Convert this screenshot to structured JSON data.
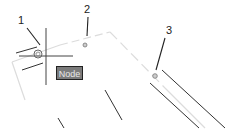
{
  "callouts": [
    {
      "label": "1"
    },
    {
      "label": "2"
    },
    {
      "label": "3"
    }
  ],
  "tooltip": {
    "text": "Node"
  },
  "colors": {
    "line": "#333333",
    "faint": "#d8d8d8",
    "tooltip_bg": "#7b7b7b"
  }
}
